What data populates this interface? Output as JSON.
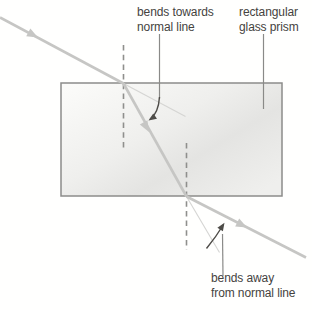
{
  "figure": {
    "labels": {
      "bends_towards": {
        "line1": "bends towards",
        "line2": "normal line"
      },
      "prism": {
        "line1": "rectangular",
        "line2": "glass prism"
      },
      "bends_away": {
        "line1": "bends away",
        "line2": "from normal line"
      }
    },
    "colors": {
      "background": "#fffffe",
      "ray": "#c6c6c4",
      "ray_faint": "#d5d5d3",
      "prism_border": "#8c8c8a",
      "prism_fill_light": "#fcfcfa",
      "prism_fill_mid": "#efefed",
      "prism_fill_dark": "#e4e4e2",
      "normal_dashed_line": "#8f8f8d",
      "leader_line": "#8a8a88",
      "annotation_arrow": "#4e4c48",
      "label_text": "#45433f"
    }
  }
}
